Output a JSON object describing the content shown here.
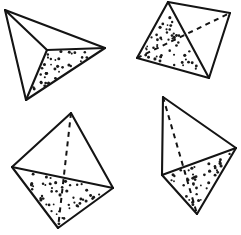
{
  "figure": {
    "title": "Four tetrahedra line drawings",
    "background_color": "#ffffff",
    "line_color": "#141414",
    "stipple_color": "#1a1a1a",
    "canvas": {
      "width": 241,
      "height": 235
    },
    "shapes": [
      {
        "id": "tetrahedron-1",
        "label": "Tetrahedron 1 (upper left)",
        "position": "upper-left",
        "vertices": {
          "A": [
            5,
            10
          ],
          "B": [
            105,
            48
          ],
          "C": [
            26,
            100
          ],
          "D": [
            47,
            50
          ]
        },
        "solid_edges": [
          [
            "A",
            "B"
          ],
          [
            "A",
            "C"
          ],
          [
            "B",
            "C"
          ],
          [
            "A",
            "D"
          ],
          [
            "B",
            "D"
          ],
          [
            "C",
            "D"
          ]
        ],
        "hidden_edges": [],
        "stippled_face": [
          "B",
          "C",
          "D"
        ],
        "stipple_count": 36
      },
      {
        "id": "tetrahedron-2",
        "label": "Tetrahedron 2 (upper right)",
        "position": "upper-right",
        "vertices": {
          "A": [
            168,
            2
          ],
          "B": [
            137,
            58
          ],
          "C": [
            209,
            78
          ],
          "D": [
            230,
            13
          ]
        },
        "solid_edges": [
          [
            "A",
            "B"
          ],
          [
            "A",
            "C"
          ],
          [
            "B",
            "C"
          ],
          [
            "C",
            "D"
          ],
          [
            "A",
            "D"
          ]
        ],
        "hidden_edges": [
          [
            "B",
            "D"
          ]
        ],
        "stippled_face": [
          "A",
          "B",
          "C"
        ],
        "stipple_count": 48
      },
      {
        "id": "tetrahedron-3",
        "label": "Tetrahedron 3 (lower left)",
        "position": "lower-left",
        "vertices": {
          "A": [
            71,
            113
          ],
          "B": [
            12,
            167
          ],
          "C": [
            113,
            188
          ],
          "D": [
            58,
            228
          ]
        },
        "solid_edges": [
          [
            "A",
            "B"
          ],
          [
            "A",
            "C"
          ],
          [
            "B",
            "C"
          ],
          [
            "B",
            "D"
          ],
          [
            "C",
            "D"
          ]
        ],
        "hidden_edges": [
          [
            "A",
            "D"
          ]
        ],
        "stippled_face": [
          "B",
          "C",
          "D"
        ],
        "stipple_count": 52
      },
      {
        "id": "tetrahedron-4",
        "label": "Tetrahedron 4 (lower right)",
        "position": "lower-right",
        "vertices": {
          "A": [
            163,
            97
          ],
          "B": [
            236,
            148
          ],
          "C": [
            162,
            175
          ],
          "D": [
            197,
            214
          ]
        },
        "solid_edges": [
          [
            "A",
            "B"
          ],
          [
            "A",
            "C"
          ],
          [
            "B",
            "C"
          ],
          [
            "B",
            "D"
          ],
          [
            "C",
            "D"
          ]
        ],
        "hidden_edges": [
          [
            "A",
            "D"
          ]
        ],
        "stippled_face": [
          "B",
          "C",
          "D"
        ],
        "stipple_count": 44
      }
    ]
  }
}
